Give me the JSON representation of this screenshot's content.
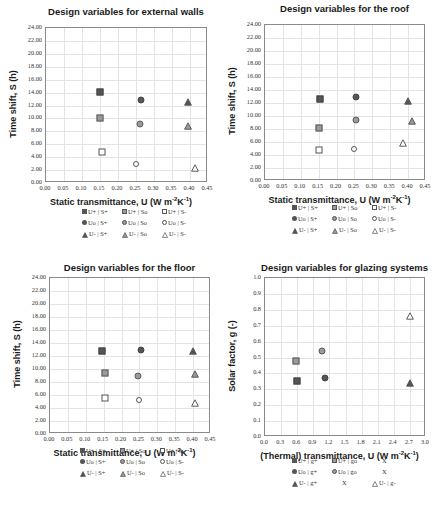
{
  "chart_data": [
    {
      "type": "scatter",
      "title": "Design variables for external walls",
      "xlabel": "Static transmittance, U (W m⁻²K⁻¹)",
      "ylabel": "Time shift, S (h)",
      "xlim": [
        0,
        0.45
      ],
      "ylim": [
        0,
        24
      ],
      "xticks": [
        "0.00",
        "0.05",
        "0.10",
        "0.15",
        "0.20",
        "0.25",
        "0.30",
        "0.35",
        "0.40",
        "0.45"
      ],
      "yticks": [
        "0.00",
        "2.00",
        "4.00",
        "6.00",
        "8.00",
        "10.00",
        "12.00",
        "14.00",
        "16.00",
        "18.00",
        "20.00",
        "22.00",
        "24.00"
      ],
      "grid": true,
      "legend_position": "bottom",
      "series": [
        {
          "name": "U+ | S+",
          "marker": "square-filled",
          "x": 0.15,
          "y": 14.1
        },
        {
          "name": "U+ | So",
          "marker": "square-mid",
          "x": 0.15,
          "y": 10.0
        },
        {
          "name": "U+ | S-",
          "marker": "square-open",
          "x": 0.155,
          "y": 4.8
        },
        {
          "name": "Uo | S+",
          "marker": "circle-filled",
          "x": 0.265,
          "y": 12.8
        },
        {
          "name": "Uo | So",
          "marker": "circle-mid",
          "x": 0.26,
          "y": 9.1
        },
        {
          "name": "Uo | S-",
          "marker": "circle-open",
          "x": 0.25,
          "y": 2.9
        },
        {
          "name": "U- | S+",
          "marker": "triangle-filled",
          "x": 0.395,
          "y": 12.6
        },
        {
          "name": "U- | So",
          "marker": "triangle-mid",
          "x": 0.395,
          "y": 8.9
        },
        {
          "name": "U- | S-",
          "marker": "triangle-open",
          "x": 0.415,
          "y": 2.3
        }
      ]
    },
    {
      "type": "scatter",
      "title": "Design variables for the roof",
      "xlabel": "Static transmittance, U (W m⁻²K⁻¹)",
      "ylabel": "Time shift, S (h)",
      "xlim": [
        0,
        0.45
      ],
      "ylim": [
        0,
        24
      ],
      "xticks": [
        "0.00",
        "0.05",
        "0.10",
        "0.15",
        "0.20",
        "0.25",
        "0.30",
        "0.35",
        "0.40",
        "0.45"
      ],
      "yticks": [
        "0.00",
        "2.00",
        "4.00",
        "6.00",
        "8.00",
        "10.00",
        "12.00",
        "14.00",
        "16.00",
        "18.00",
        "20.00",
        "22.00",
        "24.00"
      ],
      "grid": true,
      "legend_position": "bottom",
      "series": [
        {
          "name": "U+ | S+",
          "marker": "square-filled",
          "x": 0.155,
          "y": 12.6
        },
        {
          "name": "U+ | So",
          "marker": "square-mid",
          "x": 0.15,
          "y": 8.2
        },
        {
          "name": "U+ | S-",
          "marker": "square-open",
          "x": 0.15,
          "y": 4.8
        },
        {
          "name": "Uo | S+",
          "marker": "circle-filled",
          "x": 0.255,
          "y": 13.0
        },
        {
          "name": "Uo | So",
          "marker": "circle-mid",
          "x": 0.255,
          "y": 9.4
        },
        {
          "name": "Uo | S-",
          "marker": "circle-open",
          "x": 0.25,
          "y": 4.9
        },
        {
          "name": "U- | S+",
          "marker": "triangle-filled",
          "x": 0.4,
          "y": 12.3
        },
        {
          "name": "U- | So",
          "marker": "triangle-mid",
          "x": 0.41,
          "y": 9.2
        },
        {
          "name": "U- | S-",
          "marker": "triangle-open",
          "x": 0.385,
          "y": 5.8
        }
      ]
    },
    {
      "type": "scatter",
      "title": "Design variables for the floor",
      "xlabel": "Static transmittance, U (W m⁻²K⁻¹)",
      "ylabel": "Time shift, S (h)",
      "xlim": [
        0,
        0.45
      ],
      "ylim": [
        0,
        24
      ],
      "xticks": [
        "0.00",
        "0.05",
        "0.10",
        "0.15",
        "0.20",
        "0.25",
        "0.30",
        "0.35",
        "0.40",
        "0.45"
      ],
      "yticks": [
        "0.00",
        "2.00",
        "4.00",
        "6.00",
        "8.00",
        "10.00",
        "12.00",
        "14.00",
        "16.00",
        "18.00",
        "20.00",
        "22.00",
        "24.00"
      ],
      "grid": true,
      "legend_position": "bottom",
      "series": [
        {
          "name": "U+ | S+",
          "marker": "square-filled",
          "x": 0.145,
          "y": 12.8
        },
        {
          "name": "U+ | So",
          "marker": "square-mid",
          "x": 0.155,
          "y": 9.4
        },
        {
          "name": "U+ | S-",
          "marker": "square-open",
          "x": 0.155,
          "y": 5.6
        },
        {
          "name": "Uo | S+",
          "marker": "circle-filled",
          "x": 0.255,
          "y": 12.9
        },
        {
          "name": "Uo | So",
          "marker": "circle-mid",
          "x": 0.245,
          "y": 8.9
        },
        {
          "name": "Uo | S-",
          "marker": "circle-open",
          "x": 0.25,
          "y": 5.3
        },
        {
          "name": "U- | S+",
          "marker": "triangle-filled",
          "x": 0.4,
          "y": 12.8
        },
        {
          "name": "U- | So",
          "marker": "triangle-mid",
          "x": 0.405,
          "y": 9.2
        },
        {
          "name": "U- | S-",
          "marker": "triangle-open",
          "x": 0.405,
          "y": 4.8
        }
      ]
    },
    {
      "type": "scatter",
      "title": "Design  variables for glazing systems",
      "xlabel": "(Thermal) transmittance, U (W m⁻²K⁻¹)",
      "ylabel": "Solar factor, g (-)",
      "xlim": [
        0,
        3.0
      ],
      "ylim": [
        0,
        1.0
      ],
      "xticks": [
        "0.0",
        "0.3",
        "0.6",
        "0.9",
        "1.2",
        "1.5",
        "1.8",
        "2.1",
        "2.4",
        "2.7",
        "3.0"
      ],
      "yticks": [
        "0.0",
        "0.1",
        "0.2",
        "0.3",
        "0.4",
        "0.5",
        "0.6",
        "0.7",
        "0.8",
        "0.9",
        "1.0"
      ],
      "grid": true,
      "legend_position": "bottom",
      "series": [
        {
          "name": "U+ | g+",
          "marker": "square-filled",
          "x": 0.6,
          "y": 0.35
        },
        {
          "name": "U+ | go",
          "marker": "square-mid",
          "x": 0.58,
          "y": 0.48
        },
        {
          "name": "Uo | g+",
          "marker": "circle-filled",
          "x": 1.12,
          "y": 0.37
        },
        {
          "name": "Uo | go",
          "marker": "circle-mid",
          "x": 1.07,
          "y": 0.54
        },
        {
          "name": "U- | g+",
          "marker": "triangle-filled",
          "x": 2.7,
          "y": 0.34
        },
        {
          "name": "U- | g-",
          "marker": "triangle-open",
          "x": 2.7,
          "y": 0.76
        }
      ]
    }
  ],
  "charts": {
    "walls": {
      "title": "Design variables for external walls",
      "ylabel": "Time shift, S (h)",
      "xlabel_main": "Static transmittance, U (W m",
      "xlabel_sup1": "-2",
      "xlabel_mid": "K",
      "xlabel_sup2": "-1",
      "xlabel_end": ")",
      "legend": [
        [
          "U+ | S+",
          "U+ | So",
          "U+ | S-"
        ],
        [
          "Uo | S+",
          "Uo | So",
          "Uo | S-"
        ],
        [
          "U- | S+",
          "U- | So",
          "U- | S-"
        ]
      ]
    },
    "roof": {
      "title": "Design variables for the roof",
      "ylabel": "Time shift, S (h)",
      "xlabel_main": "Static transmittance, U (W m",
      "xlabel_sup1": "-2",
      "xlabel_mid": "K",
      "xlabel_sup2": "-1",
      "xlabel_end": ")",
      "legend": [
        [
          "U+ | S+",
          "U+ | So",
          "U+ | S-"
        ],
        [
          "Uo | S+",
          "Uo | So",
          "Uo | S-"
        ],
        [
          "U- | S+",
          "U- | So",
          "U- | S-"
        ]
      ]
    },
    "floor": {
      "title": "Design variables for the floor",
      "ylabel": "Time shift, S (h)",
      "xlabel_main": "Static transmittance, U (W m",
      "xlabel_sup1": "-2",
      "xlabel_mid": "K",
      "xlabel_sup2": "-1",
      "xlabel_end": ")",
      "legend": [
        [
          "U+ | S+",
          "U+ | So",
          "U+ | S-"
        ],
        [
          "Uo | S+",
          "Uo | So",
          "Uo | S-"
        ],
        [
          "U- | S+",
          "U- | So",
          "U- | S-"
        ]
      ]
    },
    "glazing": {
      "title": "Design  variables for glazing systems",
      "ylabel": "Solar factor, g (-)",
      "xlabel_main": "(Thermal) transmittance, U (W m",
      "xlabel_sup1": "-2",
      "xlabel_mid": "K",
      "xlabel_sup2": "-1",
      "xlabel_end": ")",
      "legend": [
        [
          "U+ | g+",
          "U+ | go",
          "X"
        ],
        [
          "Uo | g+",
          "Uo | go",
          "X"
        ],
        [
          "U- | g+",
          "X",
          "U- | g-"
        ]
      ]
    }
  },
  "colors": {
    "marker_dark": "#555555",
    "marker_mid": "#9a9a9a",
    "grid": "#e4e4e4",
    "axis": "#8a8a8a"
  }
}
